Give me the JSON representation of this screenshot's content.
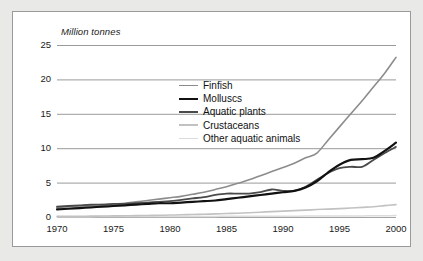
{
  "chart_data": {
    "type": "line",
    "title": "",
    "subtitle": "",
    "xlabel": "",
    "ylabel": "Million tonnes",
    "xlim": [
      1970,
      2000
    ],
    "ylim": [
      0,
      25
    ],
    "grid": true,
    "legend_position": "inside-upper-center",
    "xticks": [
      "1970",
      "1975",
      "1980",
      "1985",
      "1990",
      "1995",
      "2000"
    ],
    "yticks": [
      "0",
      "5",
      "10",
      "15",
      "20",
      "25"
    ],
    "x": [
      1970,
      1971,
      1972,
      1973,
      1974,
      1975,
      1976,
      1977,
      1978,
      1979,
      1980,
      1981,
      1982,
      1983,
      1984,
      1985,
      1986,
      1987,
      1988,
      1989,
      1990,
      1991,
      1992,
      1993,
      1994,
      1995,
      1996,
      1997,
      1998,
      1999,
      2000
    ],
    "series": [
      {
        "name": "Finfish",
        "color": "#8c8c8c",
        "width": 1.6,
        "values": [
          1.4,
          1.5,
          1.6,
          1.7,
          1.8,
          1.9,
          2.0,
          2.2,
          2.4,
          2.6,
          2.8,
          3.0,
          3.3,
          3.6,
          4.0,
          4.4,
          4.9,
          5.4,
          6.0,
          6.6,
          7.2,
          7.8,
          8.6,
          9.3,
          11.2,
          13.1,
          15.0,
          16.9,
          18.9,
          20.9,
          23.2
        ]
      },
      {
        "name": "Molluscs",
        "color": "#111111",
        "width": 2.2,
        "values": [
          1.1,
          1.2,
          1.3,
          1.4,
          1.5,
          1.6,
          1.7,
          1.8,
          1.9,
          2.0,
          2.0,
          2.1,
          2.2,
          2.3,
          2.4,
          2.6,
          2.8,
          3.0,
          3.2,
          3.4,
          3.6,
          3.8,
          4.3,
          5.2,
          6.5,
          7.6,
          8.3,
          8.4,
          8.6,
          9.6,
          10.8
        ]
      },
      {
        "name": "Aquatic plants",
        "color": "#4a4a4a",
        "width": 1.8,
        "values": [
          1.5,
          1.6,
          1.7,
          1.8,
          1.8,
          1.9,
          1.9,
          2.0,
          2.1,
          2.2,
          2.3,
          2.5,
          2.7,
          2.9,
          3.2,
          3.4,
          3.4,
          3.4,
          3.6,
          4.0,
          3.8,
          3.8,
          4.4,
          5.4,
          6.4,
          7.1,
          7.3,
          7.3,
          8.3,
          9.3,
          10.2
        ]
      },
      {
        "name": "Crustaceans",
        "color": "#c2c2c2",
        "width": 1.6,
        "values": [
          0.1,
          0.1,
          0.1,
          0.12,
          0.14,
          0.16,
          0.18,
          0.2,
          0.22,
          0.25,
          0.28,
          0.32,
          0.36,
          0.4,
          0.45,
          0.5,
          0.55,
          0.62,
          0.7,
          0.78,
          0.85,
          0.92,
          1.0,
          1.08,
          1.15,
          1.22,
          1.3,
          1.4,
          1.5,
          1.65,
          1.8
        ]
      },
      {
        "name": "Other aquatic animals",
        "color": "#dcdcdc",
        "width": 1.5,
        "values": [
          0.05,
          0.05,
          0.05,
          0.05,
          0.06,
          0.06,
          0.06,
          0.07,
          0.07,
          0.07,
          0.08,
          0.08,
          0.08,
          0.09,
          0.09,
          0.1,
          0.1,
          0.1,
          0.11,
          0.11,
          0.12,
          0.12,
          0.13,
          0.13,
          0.14,
          0.15,
          0.15,
          0.16,
          0.17,
          0.18,
          0.2
        ]
      }
    ]
  }
}
